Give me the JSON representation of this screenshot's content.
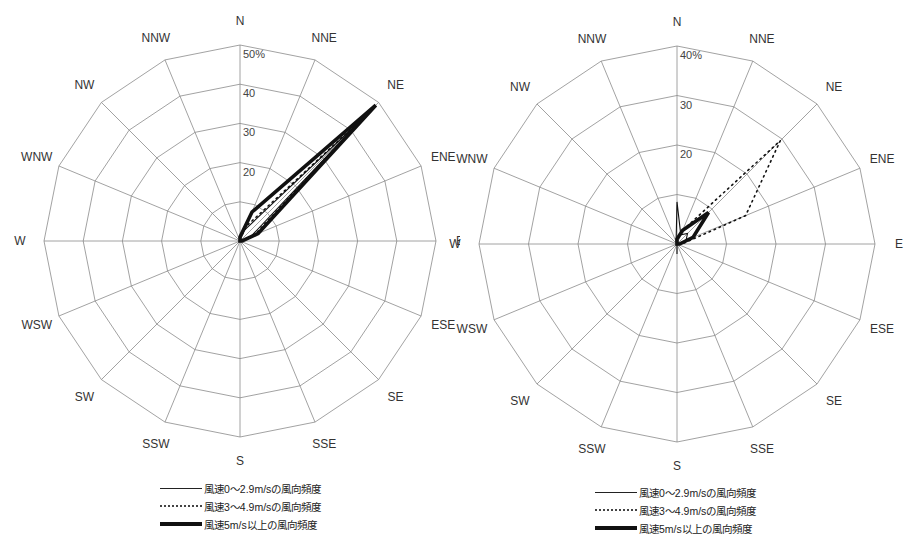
{
  "directions": [
    "N",
    "NNE",
    "NE",
    "ENE",
    "E",
    "ESE",
    "SE",
    "SSE",
    "S",
    "SSW",
    "SW",
    "WSW",
    "W",
    "WNW",
    "NW",
    "NNW"
  ],
  "legend": [
    {
      "label": "風速0～2.9m/sの風向頻度",
      "style": "solid"
    },
    {
      "label": "風速3～4.9m/sの風向頻度",
      "style": "dotted"
    },
    {
      "label": "風速5m/s以上の風向頻度",
      "style": "thick"
    }
  ],
  "colors": {
    "grid": "#8a8a8a",
    "series": "#111111"
  },
  "chart_data": [
    {
      "type": "radar",
      "title": "",
      "categories": [
        "N",
        "NNE",
        "NE",
        "ENE",
        "E",
        "ESE",
        "SE",
        "SSE",
        "S",
        "SSW",
        "SW",
        "WSW",
        "W",
        "WNW",
        "NW",
        "NNW"
      ],
      "rmax": 50,
      "ticks": [
        10,
        20,
        30,
        40,
        50
      ],
      "tick_labels": [
        "",
        "20",
        "30",
        "40",
        "50%"
      ],
      "grid": true,
      "legend_position": "bottom",
      "series": [
        {
          "name": "風速0～2.9m/sの風向頻度",
          "style": "solid",
          "values": [
            1,
            3,
            44,
            3,
            0.5,
            0,
            0,
            0,
            0,
            0,
            0,
            0,
            0,
            0,
            0,
            0
          ]
        },
        {
          "name": "風速3～4.9m/sの風向頻度",
          "style": "dotted",
          "values": [
            0.5,
            4,
            44,
            4,
            0.5,
            0,
            0,
            0,
            0,
            0,
            0,
            0,
            0,
            0,
            0,
            0
          ]
        },
        {
          "name": "風速5m/s以上の風向頻度",
          "style": "thick",
          "values": [
            1,
            8,
            49,
            5,
            0.5,
            0,
            0,
            0,
            0,
            0,
            0,
            0,
            0,
            0,
            0,
            0
          ]
        }
      ]
    },
    {
      "type": "radar",
      "title": "",
      "categories": [
        "N",
        "NNE",
        "NE",
        "ENE",
        "E",
        "ESE",
        "SE",
        "SSE",
        "S",
        "SSW",
        "SW",
        "WSW",
        "W",
        "WNW",
        "NW",
        "NNW"
      ],
      "rmax": 40,
      "ticks": [
        10,
        20,
        30,
        40
      ],
      "tick_labels": [
        "",
        "20",
        "30",
        "40%"
      ],
      "grid": true,
      "legend_position": "bottom",
      "series": [
        {
          "name": "風速0～2.9m/sの風向頻度",
          "style": "solid",
          "values": [
            8.5,
            2,
            3,
            2,
            0.5,
            0,
            0,
            0,
            2,
            0,
            0,
            0,
            0,
            0,
            0,
            0.5
          ]
        },
        {
          "name": "風速3～4.9m/sの風向頻度",
          "style": "dotted",
          "values": [
            1,
            3,
            29.5,
            15,
            1,
            0,
            0,
            0,
            0,
            0,
            0,
            0,
            0,
            0,
            0,
            0
          ]
        },
        {
          "name": "風速5m/s以上の風向頻度",
          "style": "thick",
          "values": [
            1,
            3,
            9,
            3.5,
            0.5,
            0,
            0,
            0,
            0,
            0,
            0,
            0,
            0,
            0,
            0,
            0
          ]
        }
      ]
    }
  ]
}
